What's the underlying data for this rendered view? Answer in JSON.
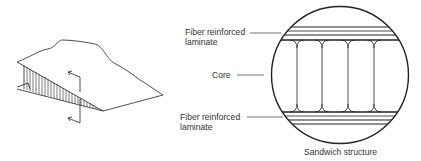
{
  "diagram": {
    "title": "Sandwich structure",
    "labels": {
      "top_laminate_line1": "Fiber reinforced",
      "top_laminate_line2": "laminate",
      "core": "Core",
      "bottom_laminate_line1": "Fiber reinforced",
      "bottom_laminate_line2": "laminate",
      "caption": "Sandwich structure"
    },
    "colors": {
      "stroke": "#222222",
      "text": "#333333",
      "background": "#ffffff"
    }
  }
}
